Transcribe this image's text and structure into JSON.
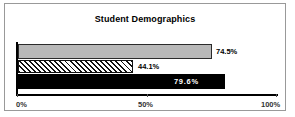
{
  "chart_data": {
    "type": "bar",
    "orientation": "horizontal",
    "title": "Student Demographics",
    "xlabel": "",
    "ylabel": "",
    "xlim": [
      0,
      100
    ],
    "xticks": [
      0,
      50,
      100
    ],
    "xtick_labels": [
      "0%",
      "50%",
      "100%"
    ],
    "grid": false,
    "legend": false,
    "categories": [
      "series-1",
      "series-2",
      "series-3"
    ],
    "values": [
      74.5,
      44.1,
      79.6
    ],
    "data_labels": [
      "74.5%",
      "44.1%",
      "79.6%"
    ],
    "bars": [
      {
        "value": 74.5,
        "label": "74.5%",
        "fill": "#b8b8b8",
        "pattern": "solid-gray",
        "label_position": "outside"
      },
      {
        "value": 44.1,
        "label": "44.1%",
        "fill": "#ffffff",
        "pattern": "diagonal-hatch",
        "label_position": "outside"
      },
      {
        "value": 79.6,
        "label": "79.6%",
        "fill": "#000000",
        "pattern": "solid-black",
        "label_position": "inside"
      }
    ]
  },
  "colors": {
    "frame": "#999999",
    "axis": "#000000",
    "bar_gray": "#b8b8b8",
    "bar_black": "#000000",
    "hatch_line": "#111111",
    "text": "#000000",
    "label_inside": "#ffffff"
  }
}
